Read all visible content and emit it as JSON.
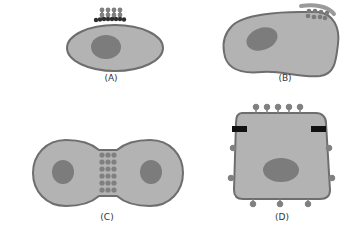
{
  "figure": {
    "colors": {
      "cytoplasm": "#b3b3b3",
      "membrane": "#6e6e6e",
      "nucleus": "#7c7c7c",
      "junction_protein": "#808080",
      "dark_band": "#2e2e2e",
      "black_bar": "#111111",
      "cap": "#9a9a9a"
    },
    "panels": [
      {
        "id": "A",
        "label": "(A)",
        "description": "oval cell with cluster of proteins on top membrane"
      },
      {
        "id": "B",
        "label": "(B)",
        "description": "elongated cell with protein cluster and cap at top-right"
      },
      {
        "id": "C",
        "label": "(C)",
        "description": "two adjacent cells joined by a column of junction proteins"
      },
      {
        "id": "D",
        "label": "(D)",
        "description": "square cell with surface proteins and dark bars on sides"
      }
    ]
  }
}
